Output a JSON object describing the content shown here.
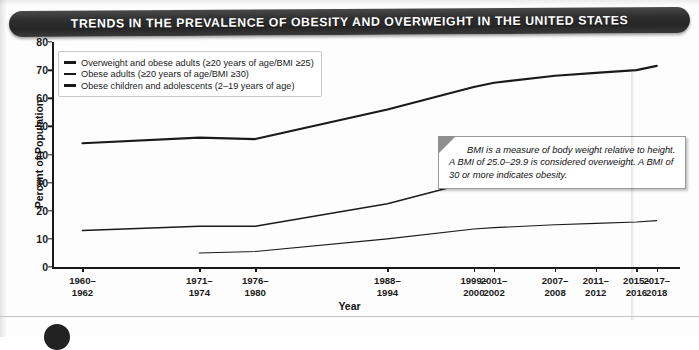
{
  "banner": {
    "title": "TRENDS IN THE PREVALENCE OF OBESITY AND OVERWEIGHT IN THE UNITED STATES"
  },
  "callout": {
    "text": "BMI is a measure of body weight relative to height. A BMI of 25.0–29.9 is considered overweight. A BMI of 30 or more indicates obesity."
  },
  "colors": {
    "banner_background": "#2f2f2f",
    "banner_text": "#ffffff",
    "line": "#1a1a1a",
    "axis": "#1a1a1a",
    "plot_background": "#ffffff"
  },
  "chart_data": {
    "type": "line",
    "title": "TRENDS IN THE PREVALENCE OF OBESITY AND OVERWEIGHT IN THE UNITED STATES",
    "xlabel": "Year",
    "ylabel": "Percent of Population",
    "ylim": [
      0,
      80
    ],
    "yticks": [
      0,
      10,
      20,
      30,
      40,
      50,
      60,
      70,
      80
    ],
    "grid": false,
    "legend_position": "top-left",
    "categories": [
      "1960–1962",
      "1971–1974",
      "1976–1980",
      "1988–1994",
      "1999–2000",
      "2001–2002",
      "2007–2008",
      "2011–2012",
      "2015–2016",
      "2017–2018"
    ],
    "category_positions": [
      1961,
      1972.5,
      1978,
      1991,
      1999.5,
      2001.5,
      2007.5,
      2011.5,
      2015.5,
      2017.5
    ],
    "xlim": [
      1958,
      2019
    ],
    "series": [
      {
        "name": "Overweight and obese adults (≥20 years of age/BMI ≥25)",
        "values": [
          44.0,
          46.0,
          45.5,
          56.0,
          64.0,
          65.5,
          68.0,
          69.0,
          70.0,
          71.5
        ]
      },
      {
        "name": "Obese adults (≥20 years of age/BMI ≥30)",
        "values": [
          13.0,
          14.5,
          14.5,
          22.5,
          30.5,
          31.0,
          33.5,
          35.0,
          39.5,
          42.0
        ]
      },
      {
        "name": "Obese children and adolescents (2–19 years of age)",
        "values": [
          null,
          5.0,
          5.5,
          10.0,
          13.5,
          14.0,
          15.0,
          15.5,
          16.0,
          16.5
        ]
      }
    ]
  },
  "legend": {
    "items": [
      "Overweight and obese adults (≥20 years of age/BMI ≥25)",
      "Obese adults (≥20 years of age/BMI ≥30)",
      "Obese children and adolescents (2–19 years of age)"
    ]
  }
}
